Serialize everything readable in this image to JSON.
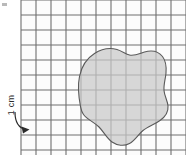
{
  "figure": {
    "type": "grid-with-irregular-shape",
    "background_color": "#ffffff"
  },
  "grid": {
    "label": "centimeter-grid",
    "cell_size_px": 15,
    "cell_size_label": "1 cm",
    "columns": 11,
    "rows": 11,
    "origin_x": 21,
    "origin_y": 0,
    "width_px": 165,
    "height_px": 155,
    "line_color": "#6e6e6e",
    "line_width": 1.1,
    "cell_interior_color": "#fcfcfc"
  },
  "shape": {
    "label": "irregular-blob",
    "fill_color": "#c9c9c9",
    "fill_opacity": 0.72,
    "stroke_color": "#5a5a5a",
    "stroke_width": 1.1,
    "path": "M 80.5 106.5 C 78.5 96 77.5 86 79.5 76.5 C 81.5 66.5 86.5 58.5 94.5 53.5 C 101.5 49 109.5 47.5 117 49.5 C 122 51 125.5 54 129.5 55 C 134.5 56.2 139.5 53.5 144.5 52 C 151.5 50 158.5 51.5 162.5 56.5 C 166 61 166.5 67 166 73 C 165.5 79 163.5 84.5 164 90.5 C 164.5 96 167.5 100.5 168 106 C 168.5 112 165 117 160 120.5 C 154.5 124.5 148 126.5 143 130.5 C 138 134.5 135 140.5 129.5 143.5 C 124 146.5 117 145.5 112 142 C 106.5 138 103.5 131.5 99 127 C 94 122 87 119.5 83.5 114.5 C 81.5 111.8 81 109 80.5 106.5 Z",
    "bounds": {
      "x_min": 77,
      "y_min": 47,
      "x_max": 168,
      "y_max": 146
    }
  },
  "annotation": {
    "label": "scale-annotation",
    "text": "1 cm",
    "text_rotation_degrees": -90,
    "text_x": 14,
    "text_y": 105,
    "arrow_color": "#2b2b2b",
    "arrow_width": 1.2,
    "arrow_path": "M 15 112 C 15 122 18 128 26 129.5",
    "arrow_head_points": "29.5,129.5 21.5,126.5 23,133.5"
  },
  "artifacts": {
    "corner_speck": {
      "label": "scan-artifact-speck",
      "x": 2,
      "y": 3,
      "width": 5,
      "height": 3,
      "color": "#b9b9b9"
    }
  }
}
